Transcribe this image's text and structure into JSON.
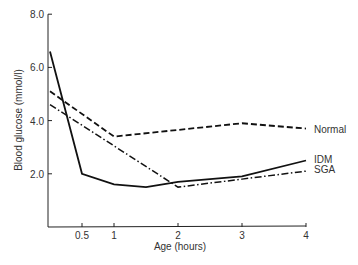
{
  "chart_data": {
    "type": "line",
    "title": "",
    "xlabel": "Age (hours)",
    "ylabel": "Blood glucose (mmol/l)",
    "xlim": [
      0,
      4
    ],
    "ylim": [
      0,
      8
    ],
    "x_ticks": [
      0.5,
      1,
      2,
      3,
      4
    ],
    "x_tick_labels": [
      "0.5",
      "1",
      "2",
      "3",
      "4"
    ],
    "y_ticks": [
      2,
      4,
      6,
      8
    ],
    "y_tick_labels": [
      "2.0",
      "4.0",
      "6.0",
      "8.0"
    ],
    "grid": false,
    "legend_position": "inline-right",
    "series": [
      {
        "name": "Normal",
        "style": "dashed",
        "x": [
          0,
          1,
          3,
          4
        ],
        "values": [
          5.1,
          3.4,
          3.9,
          3.7
        ]
      },
      {
        "name": "IDM",
        "style": "solid",
        "x": [
          0,
          0.5,
          1,
          1.5,
          2,
          3,
          4
        ],
        "values": [
          6.6,
          2.0,
          1.6,
          1.5,
          1.7,
          1.9,
          2.5
        ]
      },
      {
        "name": "SGA",
        "style": "dash-dot",
        "x": [
          0,
          2,
          3,
          4
        ],
        "values": [
          4.6,
          1.5,
          1.8,
          2.1
        ]
      }
    ]
  }
}
